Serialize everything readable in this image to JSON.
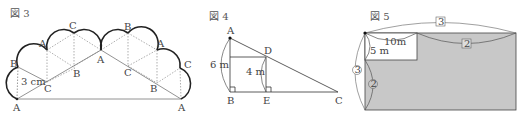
{
  "figure3": {
    "caption": "図 3",
    "length_label": "3 cm",
    "vertex_labels": {
      "base_left": "A",
      "left_top": "B",
      "arc1_peak": "A",
      "arc2_peak": "C",
      "apex": "A",
      "inner_c1": "C",
      "inner_b1": "B",
      "arc3_peak": "B",
      "arc4_peak": "A",
      "inner_c2": "C",
      "inner_b2": "B",
      "right_c": "C",
      "base_right": "A"
    }
  },
  "figure4": {
    "caption": "図 4",
    "labels": {
      "A": "A",
      "B": "B",
      "C": "C",
      "D": "D",
      "E": "E"
    },
    "length_AB": "6 m",
    "length_DE": "4 m"
  },
  "figure5": {
    "caption": "図 5",
    "width_label": "10m",
    "height_label": "5 m",
    "top_ratio": "3",
    "top_right_ratio": "2",
    "left_ratio": "3",
    "left_lower_ratio": "2",
    "fill_color": "#c8c8c8"
  }
}
